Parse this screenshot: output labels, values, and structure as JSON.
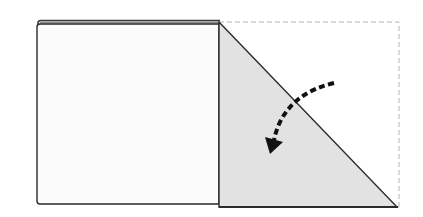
{
  "diagram": {
    "type": "origami-fold-step",
    "colors": {
      "background": "#ffffff",
      "paper_front": "#fbfbfb",
      "paper_folded": "#e2e2e2",
      "outline": "#2a2a2a",
      "guide_dashed": "#b0b0b0",
      "arrow": "#111111"
    },
    "shapes": {
      "left_square": {
        "x": 37,
        "y": 24,
        "width": 182,
        "height": 180
      },
      "back_layer_edge": {
        "x1": 41,
        "y1": 21,
        "x2": 219,
        "y2": 21
      },
      "folded_triangle": {
        "points": [
          [
            219,
            22
          ],
          [
            219,
            207
          ],
          [
            397,
            207
          ]
        ]
      },
      "original_outline_dashed": {
        "points": [
          [
            219,
            22
          ],
          [
            399,
            22
          ],
          [
            399,
            207
          ]
        ]
      },
      "fold_arrow": {
        "style": "dashed-curved",
        "start": [
          334,
          83
        ],
        "end": [
          270,
          150
        ],
        "direction": "counter-clockwise-down-left"
      }
    }
  }
}
